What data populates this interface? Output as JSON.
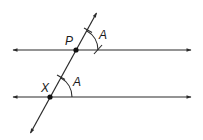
{
  "diagram": {
    "type": "geometry-construction",
    "colors": {
      "stroke": "#2a2a2a",
      "background": "#ffffff"
    },
    "labels": {
      "point_p": "P",
      "point_x": "X",
      "angle_upper": "A",
      "angle_lower": "A"
    },
    "points": {
      "P": {
        "x": 76,
        "y": 50
      },
      "X": {
        "x": 50,
        "y": 97
      }
    },
    "lines": [
      {
        "name": "upper-line",
        "from": [
          12,
          50
        ],
        "to": [
          192,
          50
        ],
        "arrows": "both"
      },
      {
        "name": "lower-line",
        "from": [
          12,
          97
        ],
        "to": [
          192,
          97
        ],
        "arrows": "both"
      },
      {
        "name": "transversal",
        "from": [
          30,
          134
        ],
        "to": [
          97,
          12
        ],
        "arrows": "both"
      }
    ],
    "arcs": [
      {
        "name": "upper-angle-arc",
        "center": "P",
        "radius": 22
      },
      {
        "name": "lower-angle-arc",
        "center": "X",
        "radius": 22
      }
    ]
  }
}
